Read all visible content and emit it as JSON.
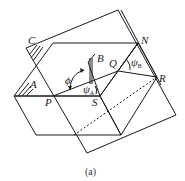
{
  "figure": {
    "caption": "(a)",
    "stroke_color": "#1a1a1a",
    "labels": {
      "C": "C",
      "A": "A",
      "B": "B",
      "N": "N",
      "Q": "Q",
      "R": "R",
      "P": "P",
      "S": "S",
      "phi": "ϕ",
      "psi_A": "ψ",
      "psi_A_sub": "A",
      "psi_B": "ψ",
      "psi_B_sub": "B"
    }
  }
}
